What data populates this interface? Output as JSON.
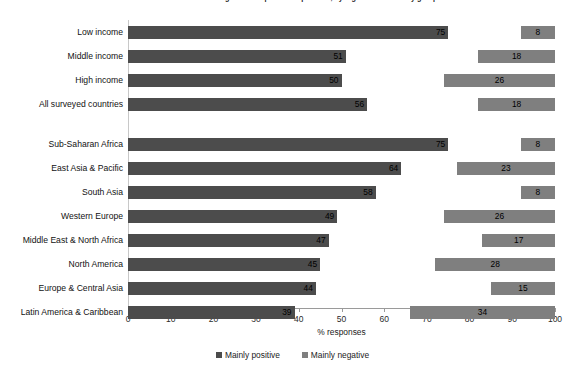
{
  "chart_data": {
    "type": "bar",
    "orientation": "horizontal",
    "title": "Figure: Perceptions of openness, by region and economy groups",
    "xlabel": "% responses",
    "ylabel": "",
    "xlim": [
      0,
      100
    ],
    "xticks": [
      0,
      10,
      20,
      30,
      40,
      50,
      60,
      70,
      80,
      90,
      100
    ],
    "xtick_labels": [
      "0",
      "10",
      "20",
      "30",
      "40",
      "50",
      "60",
      "70",
      "80",
      "90",
      "100"
    ],
    "grid": false,
    "legend_position": "bottom-center",
    "stacked_from_both_ends": true,
    "note": "Mainly positive bars grow rightward from 0; Mainly negative bars are right-aligned and end at 100.",
    "series": [
      {
        "name": "Mainly positive",
        "color": "#4c4c4c",
        "values": [
          75,
          51,
          50,
          56,
          75,
          64,
          58,
          49,
          47,
          45,
          44,
          39
        ]
      },
      {
        "name": "Mainly negative",
        "color": "#7f7f7f",
        "values": [
          8,
          18,
          26,
          18,
          8,
          23,
          8,
          26,
          17,
          28,
          15,
          34
        ]
      }
    ],
    "categories": [
      "Low income",
      "Middle income",
      "High income",
      "All surveyed countries",
      "Sub-Saharan Africa",
      "East Asia & Pacific",
      "South Asia",
      "Western Europe",
      "Middle East & North Africa",
      "North America",
      "Europe & Central Asia",
      "Latin America & Caribbean"
    ],
    "groups": [
      {
        "name": "economy-groups",
        "categories": [
          0,
          1,
          2,
          3
        ]
      },
      {
        "name": "regions",
        "categories": [
          4,
          5,
          6,
          7,
          8,
          9,
          10,
          11
        ]
      }
    ]
  },
  "legend": {
    "items": [
      {
        "label": "Mainly positive",
        "color": "#4c4c4c"
      },
      {
        "label": "Mainly negative",
        "color": "#7f7f7f"
      }
    ]
  },
  "rows": [
    {
      "label": "Low income",
      "positive": 75,
      "negative": 8,
      "top": 6
    },
    {
      "label": "Middle income",
      "positive": 51,
      "negative": 18,
      "top": 30
    },
    {
      "label": "High income",
      "positive": 50,
      "negative": 26,
      "top": 54
    },
    {
      "label": "All surveyed countries",
      "positive": 56,
      "negative": 18,
      "top": 78
    },
    {
      "label": "Sub-Saharan Africa",
      "positive": 75,
      "negative": 8,
      "top": 118
    },
    {
      "label": "East Asia & Pacific",
      "positive": 64,
      "negative": 23,
      "top": 142
    },
    {
      "label": "South Asia",
      "positive": 58,
      "negative": 8,
      "top": 166
    },
    {
      "label": "Western Europe",
      "positive": 49,
      "negative": 26,
      "top": 190
    },
    {
      "label": "Middle East & North Africa",
      "positive": 47,
      "negative": 17,
      "top": 214
    },
    {
      "label": "North America",
      "positive": 45,
      "negative": 28,
      "top": 238
    },
    {
      "label": "Europe & Central Asia",
      "positive": 44,
      "negative": 15,
      "top": 262
    },
    {
      "label": "Latin America & Caribbean",
      "positive": 39,
      "negative": 34,
      "top": 286
    }
  ]
}
